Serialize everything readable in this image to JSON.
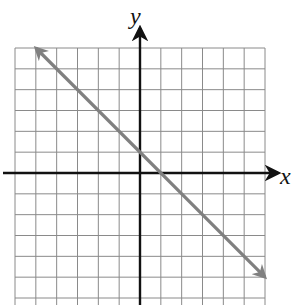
{
  "chart_data": {
    "type": "line",
    "title": "",
    "xlabel": "x",
    "ylabel": "y",
    "xlim": [
      -6,
      6
    ],
    "ylim": [
      -6,
      6
    ],
    "grid": true,
    "grid_step": 1,
    "equation": "y = -x + 1",
    "series": [
      {
        "name": "line",
        "color": "#808080",
        "x": [
          -5,
          6
        ],
        "y": [
          6,
          -5
        ],
        "arrows": "both"
      }
    ],
    "intercepts": {
      "x_intercept": 1,
      "y_intercept": 1
    }
  },
  "colors": {
    "grid": "#8a8a8a",
    "axis": "#111111",
    "line": "#808080"
  },
  "labels": {
    "x_axis": "x",
    "y_axis": "y"
  }
}
